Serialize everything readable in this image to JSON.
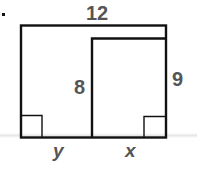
{
  "diagram": {
    "labels": {
      "top": "12",
      "inner_height": "8",
      "right_side": "9",
      "bottom_left": "y",
      "bottom_right": "x"
    },
    "bullet": "•",
    "colors": {
      "stroke": "#111111",
      "label": "#555555"
    }
  }
}
